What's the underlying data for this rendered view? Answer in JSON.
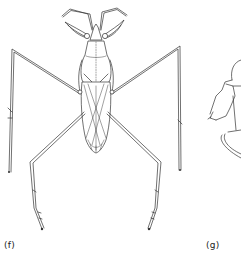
{
  "figure": {
    "panels": [
      {
        "id": "f",
        "label": "(f)",
        "subject": "insect line drawing, dorsal view, long-legged with raptorial forelegs"
      },
      {
        "id": "g",
        "label": "(g)",
        "subject": "partial insect line drawing, cropped at right edge"
      }
    ],
    "colors": {
      "background": "#ffffff",
      "ink": "#333333"
    }
  }
}
